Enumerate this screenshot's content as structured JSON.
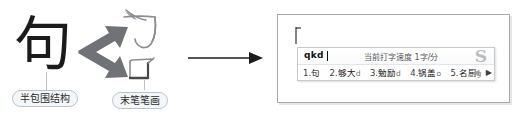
{
  "diagram": {
    "source_character": "句",
    "decomposition": [
      {
        "glyph": "勹",
        "icon": "bao-radical-glyph"
      },
      {
        "glyph": "口",
        "icon": "kou-last-stroke-glyph"
      }
    ],
    "labels": {
      "structure": "半包围结构",
      "last_stroke": "末笔笔画"
    },
    "arrows": {
      "branch_up": "arrow-up-right-icon",
      "branch_down": "arrow-down-right-icon",
      "flow": "arrow-right-icon"
    }
  },
  "document_window": {
    "caret": "text-caret-icon"
  },
  "ime": {
    "input_text": "qkd",
    "status_text": "当前打字速度 1字/分",
    "logo": "sogou-logo-icon",
    "candidates": [
      {
        "index": "1.",
        "word": "句",
        "tail": ""
      },
      {
        "index": "2.",
        "word": "够大",
        "tail": "d"
      },
      {
        "index": "3.",
        "word": "勉励",
        "tail": "d"
      },
      {
        "index": "4.",
        "word": "锅盖",
        "tail": "o"
      },
      {
        "index": "5.",
        "word": "名厨",
        "tail": "g"
      }
    ],
    "pager": {
      "prev": "◀",
      "next": "▶"
    }
  },
  "colors": {
    "arrow_gray": "#6f7277",
    "pill_border": "#b7c2cb",
    "pill_fill": "#f4f7f9",
    "window_border": "#a9a9a9",
    "ime_border": "#c6c9cc",
    "logo_gray": "#b9bdc2"
  }
}
